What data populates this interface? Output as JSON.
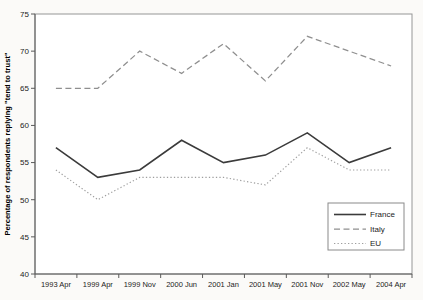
{
  "figure": {
    "background": "#fbfaf8",
    "plot_background": "#ffffff"
  },
  "chart_data": {
    "type": "line",
    "title": "",
    "xlabel": "",
    "ylabel": "Percentage of respondents replying \"tend to trust\"",
    "ylim": [
      40,
      75
    ],
    "yticks": [
      40,
      45,
      50,
      55,
      60,
      65,
      70,
      75
    ],
    "grid": false,
    "legend_position": "inside-bottom-right",
    "categories": [
      "1993 Apr",
      "1999 Apr",
      "1999 Nov",
      "2000 Jun",
      "2001 Jan",
      "2001 May",
      "2001 Nov",
      "2002 May",
      "2004 Apr"
    ],
    "series": [
      {
        "name": "France",
        "style": "solid",
        "color": "#3b3b3b",
        "width": 1.6,
        "values": [
          57,
          53,
          54,
          58,
          55,
          56,
          59,
          55,
          57
        ]
      },
      {
        "name": "Italy",
        "style": "dashed",
        "color": "#8f8f8f",
        "width": 1.25,
        "values": [
          65,
          65,
          70,
          67,
          71,
          66,
          72,
          70,
          68
        ]
      },
      {
        "name": "EU",
        "style": "dotted",
        "color": "#9e9e9e",
        "width": 1.15,
        "values": [
          54,
          50,
          53,
          53,
          53,
          52,
          57,
          54,
          54
        ]
      }
    ],
    "frame_color": "#969696",
    "axis_color": "#5a5a5a",
    "text_color": "#1c1c1c"
  }
}
